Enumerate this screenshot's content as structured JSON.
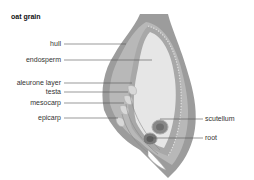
{
  "title": "oat grain",
  "labels": {
    "hull": "hull",
    "endosperm": "endosperm",
    "aleurone_layer": "aleurone layer",
    "testa": "testa",
    "mesocarp": "mesocarp",
    "epicarp": "epicarp",
    "scutellum": "scutellum",
    "root": "root"
  },
  "colors": {
    "hull": "#9a9a9a",
    "inner_layer": "#c4c4c4",
    "endosperm": "#e6e6e6",
    "leader_line": "#555555"
  }
}
